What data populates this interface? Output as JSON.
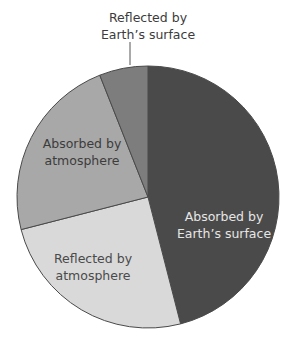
{
  "chart_data": {
    "type": "pie",
    "title": "",
    "start_angle_deg": 0,
    "direction": "clockwise",
    "slices": [
      {
        "label_lines": [
          "Absorbed by",
          "Earth’s surface"
        ],
        "value": 46,
        "color": "#4a4a4a",
        "text_color": "#e6e6e6",
        "label_pos": [
          224,
          221
        ]
      },
      {
        "label_lines": [
          "Reflected by",
          "atmosphere"
        ],
        "value": 25,
        "color": "#d9d9d9",
        "text_color": "#4a4a4a",
        "label_pos": [
          93,
          263
        ]
      },
      {
        "label_lines": [
          "Absorbed by",
          "atmosphere"
        ],
        "value": 23,
        "color": "#a8a8a8",
        "text_color": "#3c3c3c",
        "label_pos": [
          82,
          148
        ]
      },
      {
        "label_lines": [
          "Reflected by",
          "Earth’s surface"
        ],
        "value": 6,
        "color": "#7d7d7d",
        "text_color": "#3c3c3c",
        "label_pos": [
          148,
          22
        ],
        "leader": [
          130,
          42,
          130,
          65
        ]
      }
    ],
    "center": [
      148,
      197
    ],
    "radius": 131,
    "legend": "none",
    "grid": false
  }
}
